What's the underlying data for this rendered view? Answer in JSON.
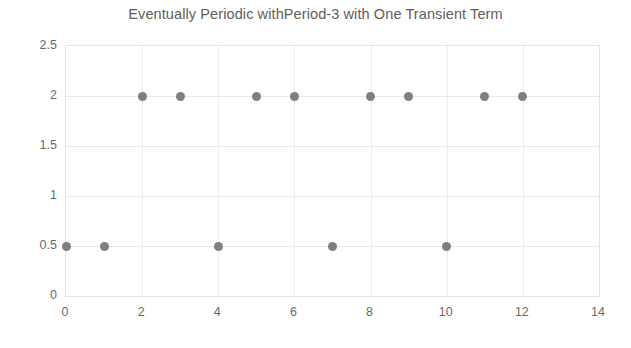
{
  "chart_data": {
    "type": "scatter",
    "title": "Eventually Periodic withPeriod-3 with One Transient Term",
    "xlabel": "",
    "ylabel": "",
    "xlim": [
      0,
      14
    ],
    "ylim": [
      0,
      2.5
    ],
    "grid": true,
    "legend": null,
    "legend_position": "none",
    "marker": {
      "shape": "circle",
      "color": "#7f7f7f",
      "size_px": 9
    },
    "xticks": [
      0,
      2,
      4,
      6,
      8,
      10,
      12,
      14
    ],
    "xtick_labels": [
      "0",
      "2",
      "4",
      "6",
      "8",
      "10",
      "12",
      "14"
    ],
    "yticks": [
      0,
      0.5,
      1,
      1.5,
      2,
      2.5
    ],
    "ytick_labels": [
      "0",
      "0.5",
      "1",
      "1.5",
      "2",
      "2.5"
    ],
    "x": [
      0,
      1,
      2,
      3,
      4,
      5,
      6,
      7,
      8,
      9,
      10,
      11,
      12
    ],
    "values": [
      0.5,
      0.5,
      2,
      2,
      0.5,
      2,
      2,
      0.5,
      2,
      2,
      0.5,
      2,
      2
    ],
    "points": [
      {
        "x": 0,
        "y": 0.5
      },
      {
        "x": 1,
        "y": 0.5
      },
      {
        "x": 2,
        "y": 2
      },
      {
        "x": 3,
        "y": 2
      },
      {
        "x": 4,
        "y": 0.5
      },
      {
        "x": 5,
        "y": 2
      },
      {
        "x": 6,
        "y": 2
      },
      {
        "x": 7,
        "y": 0.5
      },
      {
        "x": 8,
        "y": 2
      },
      {
        "x": 9,
        "y": 2
      },
      {
        "x": 10,
        "y": 0.5
      },
      {
        "x": 11,
        "y": 2
      },
      {
        "x": 12,
        "y": 2
      }
    ]
  },
  "style": {
    "title_color": "#5d5d5d",
    "tick_color": "#6a6a6a",
    "gridline_color": "#e9e9e9",
    "axis_border_color": "#e3e3e3",
    "background_color": "#ffffff"
  }
}
